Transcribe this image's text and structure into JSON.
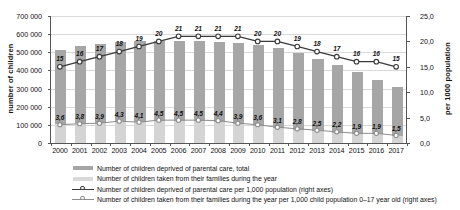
{
  "chart_data": {
    "type": "bar",
    "title": "",
    "xlabel": "",
    "ylabel": "number of children",
    "y2label": "per 1000 population",
    "grid": true,
    "legend_position": "bottom",
    "categories": [
      "2000",
      "2001",
      "2002",
      "2003",
      "2004",
      "2005",
      "2006",
      "2007",
      "2008",
      "2009",
      "2010",
      "2011",
      "2012",
      "2013",
      "2014",
      "2015",
      "2016",
      "2017"
    ],
    "ylim": [
      0,
      700000
    ],
    "yticks": [
      0,
      100000,
      200000,
      300000,
      400000,
      500000,
      600000,
      700000
    ],
    "ytick_labels": [
      "0",
      "100 000",
      "200 000",
      "300 000",
      "400 000",
      "500 000",
      "600 000",
      "700 000"
    ],
    "y2lim": [
      0,
      25
    ],
    "y2ticks": [
      0,
      5,
      10,
      15,
      20,
      25
    ],
    "y2tick_labels": [
      "0,0",
      "5,0",
      "10,0",
      "15,0",
      "20,0",
      "25,0"
    ],
    "series": [
      {
        "name": "Number of children deprived of parental care, total",
        "kind": "bar",
        "axis": "left",
        "color": "#a6a6a6",
        "values": [
          512000,
          536000,
          548000,
          557000,
          562000,
          565000,
          563000,
          560000,
          556000,
          552000,
          540000,
          521000,
          496000,
          465000,
          430000,
          389000,
          350000,
          310000
        ]
      },
      {
        "name": "Number of children taken from their families during the year",
        "kind": "bar",
        "axis": "left",
        "color": "#d4d4d4",
        "values": [
          104000,
          110000,
          112000,
          120000,
          114000,
          123000,
          122000,
          122000,
          118000,
          104000,
          95000,
          81000,
          73000,
          65000,
          57000,
          49000,
          48000,
          39000
        ]
      },
      {
        "name": "Number of children deprived of parental care per 1,000 population (right axes)",
        "kind": "line",
        "axis": "right",
        "color": "#3a3a3a",
        "marker": "open-circle",
        "values": [
          15,
          16,
          17,
          18,
          19,
          20,
          21,
          21,
          21,
          21,
          20,
          20,
          19,
          18,
          17,
          16,
          16,
          15
        ],
        "labels": [
          "15",
          "16",
          "17",
          "18",
          "19",
          "20",
          "21",
          "21",
          "21",
          "21",
          "20",
          "20",
          "19",
          "18",
          "17",
          "16",
          "16",
          "15"
        ]
      },
      {
        "name": "Number of children taken from their families during the year per 1,000 child population 0–17 year old (right axes)",
        "kind": "line",
        "axis": "right",
        "color": "#8d8d8d",
        "marker": "open-circle",
        "values": [
          3.6,
          3.8,
          3.9,
          4.3,
          4.1,
          4.5,
          4.5,
          4.5,
          4.4,
          3.9,
          3.6,
          3.1,
          2.8,
          2.5,
          2.2,
          1.9,
          1.9,
          1.5
        ],
        "labels": [
          "3,6",
          "3,8",
          "3,9",
          "4,3",
          "4,1",
          "4,5",
          "4,5",
          "4,5",
          "4,4",
          "3,9",
          "3,6",
          "3,1",
          "2,8",
          "2,5",
          "2,2",
          "1,9",
          "1,9",
          "1,5"
        ]
      }
    ]
  },
  "axes": {
    "left_title": "number of children",
    "right_title": "per 1000 population"
  },
  "legend": {
    "items": [
      {
        "label": "Number of children deprived of parental care, total",
        "key": "swatch-dark"
      },
      {
        "label": "Number of children taken from their families during the year",
        "key": "swatch-light"
      },
      {
        "label": "Number of children deprived of parental care per 1,000 population (right axes)",
        "key": "line-dark"
      },
      {
        "label": "Number of children taken from their families during the year per 1,000 child population 0–17 year old (right axes)",
        "key": "line-light"
      }
    ]
  }
}
